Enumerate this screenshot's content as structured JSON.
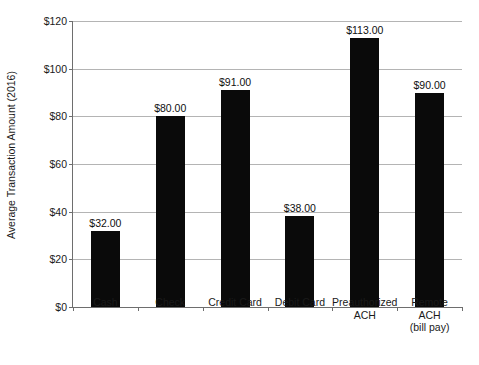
{
  "figure": {
    "clipped_title_remnant": "",
    "background_color": "#ffffff",
    "bar_color": "#0a0a0a",
    "gridline_color": "#b4b4b4",
    "axis_color": "#6e6e6e"
  },
  "chart_data": {
    "type": "bar",
    "title": "",
    "xlabel": "",
    "ylabel": "Average Transaction Amount (2016)",
    "categories": [
      "Cash",
      "Check",
      "Credit Card",
      "Debit Card",
      "Preauthorized ACH",
      "Remote ACH (bill pay)"
    ],
    "category_lines": [
      [
        "Cash"
      ],
      [
        "Check"
      ],
      [
        "Credit Card"
      ],
      [
        "Debit Card"
      ],
      [
        "Preauthorized",
        "ACH"
      ],
      [
        "Remote",
        "ACH",
        "(bill pay)"
      ]
    ],
    "values": [
      32,
      80,
      91,
      38,
      113,
      90
    ],
    "data_labels": [
      "$32.00",
      "$80.00",
      "$91.00",
      "$38.00",
      "$113.00",
      "$90.00"
    ],
    "ylim": [
      0,
      120
    ],
    "yticks": [
      0,
      20,
      40,
      60,
      80,
      100,
      120
    ],
    "ytick_labels": [
      "$0",
      "$20",
      "$40",
      "$60",
      "$80",
      "$100",
      "$120"
    ],
    "grid": true,
    "legend": null
  }
}
